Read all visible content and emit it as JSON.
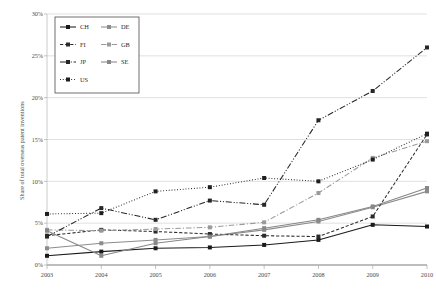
{
  "chart_data": {
    "type": "line",
    "title": "",
    "xlabel": "",
    "ylabel": "Share of total overseas patent inventions",
    "x": [
      2003,
      2004,
      2005,
      2006,
      2007,
      2008,
      2009,
      2010
    ],
    "xtick_labels": [
      "2003",
      "2004",
      "2005",
      "2006",
      "2007",
      "2008",
      "2009",
      "2010"
    ],
    "ytick_labels": [
      "0%",
      "5%",
      "10%",
      "15%",
      "20%",
      "25%",
      "30%"
    ],
    "ytick_values": [
      0,
      5,
      10,
      15,
      20,
      25,
      30
    ],
    "ylim": [
      0,
      30
    ],
    "xlim": [
      2003,
      2010
    ],
    "grid": "horizontal",
    "legend_position": "upper-left-inside",
    "series": [
      {
        "name": "CH",
        "label": "CH",
        "color": "#1a1a1a",
        "style": "solid",
        "marker": "square",
        "values": [
          1.1,
          1.6,
          2.0,
          2.1,
          2.4,
          3.0,
          4.8,
          4.6
        ]
      },
      {
        "name": "DE",
        "label": "DE",
        "color": "#8c8c8c",
        "style": "solid",
        "marker": "square",
        "values": [
          2.0,
          2.6,
          3.0,
          3.4,
          4.2,
          5.2,
          6.9,
          8.8
        ]
      },
      {
        "name": "FI",
        "label": "FI",
        "color": "#2b2b2b",
        "style": "dashed",
        "marker": "square",
        "values": [
          3.5,
          4.2,
          4.0,
          3.7,
          3.5,
          3.4,
          5.8,
          15.6
        ]
      },
      {
        "name": "GB",
        "label": "GB",
        "color": "#9a9a9a",
        "style": "dashdot",
        "marker": "square",
        "values": [
          4.2,
          4.1,
          4.3,
          4.5,
          5.1,
          8.6,
          12.8,
          14.8
        ]
      },
      {
        "name": "JP",
        "label": "JP",
        "color": "#262626",
        "style": "dashdotdot",
        "marker": "square",
        "values": [
          3.4,
          6.8,
          5.4,
          7.7,
          7.2,
          17.3,
          20.8,
          26.0
        ]
      },
      {
        "name": "SE",
        "label": "SE",
        "color": "#878787",
        "style": "solid",
        "marker": "square",
        "values": [
          4.1,
          1.1,
          2.6,
          3.4,
          4.4,
          5.4,
          7.0,
          9.2
        ]
      },
      {
        "name": "US",
        "label": "US",
        "color": "#1f1f1f",
        "style": "dotted",
        "marker": "square",
        "values": [
          6.1,
          6.2,
          8.8,
          9.3,
          10.4,
          10.0,
          12.6,
          15.7
        ]
      }
    ]
  },
  "legend": {
    "entries": [
      {
        "label": "CH"
      },
      {
        "label": "DE"
      },
      {
        "label": "FI"
      },
      {
        "label": "GB"
      },
      {
        "label": "JP"
      },
      {
        "label": "SE"
      },
      {
        "label": "US"
      }
    ]
  }
}
